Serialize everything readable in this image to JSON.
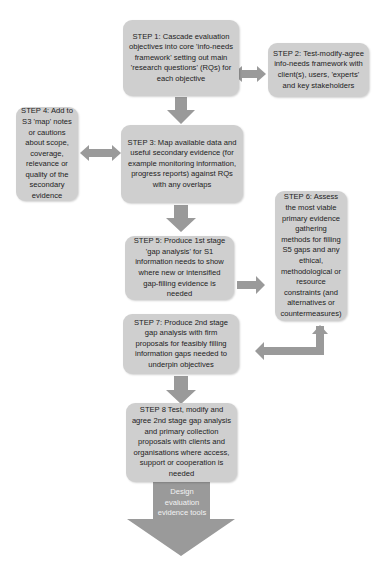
{
  "diagram": {
    "type": "flowchart",
    "colors": {
      "box_fill": "#cfcfcf",
      "arrow_fill": "#9a9a9a",
      "text": "#222222"
    },
    "steps": [
      {
        "id": "step1",
        "text": "STEP 1: Cascade evaluation objectives into core 'info-needs framework' setting out main 'research questions' (RQs) for each objective"
      },
      {
        "id": "step2",
        "text": "STEP 2: Test-modify-agree info-needs framework with client(s), users, 'experts' and key stakeholders"
      },
      {
        "id": "step3",
        "text": "STEP 3: Map available data and useful secondary evidence (for example monitoring information, progress reports) against RQs with any overlaps"
      },
      {
        "id": "step4",
        "text": "STEP 4: Add to S3 'map' notes or cautions about scope, coverage, relevance or quality of the secondary evidence"
      },
      {
        "id": "step5",
        "text": "STEP 5: Produce 1st stage 'gap analysis' for S1 information needs to show where new or intensified gap-filling evidence is needed"
      },
      {
        "id": "step6",
        "text": "STEP 6: Assess the most viable primary evidence gathering methods for filling S5 gaps and any ethical, methodological or resource constraints (and alternatives or countermeasures)"
      },
      {
        "id": "step7",
        "text": "STEP 7: Produce 2nd stage gap analysis with firm proposals for feasibly filling information gaps needed to underpin objectives"
      },
      {
        "id": "step8",
        "text": "STEP 8 Test, modify and agree 2nd stage gap analysis and primary collection proposals with clients and organisations where access, support or cooperation is needed"
      }
    ],
    "final_output": {
      "text": "Design evaluation evidence tools"
    },
    "connections": [
      {
        "from": "step1",
        "to": "step2",
        "type": "bidirectional"
      },
      {
        "from": "step1",
        "to": "step3",
        "type": "down"
      },
      {
        "from": "step3",
        "to": "step4",
        "type": "bidirectional"
      },
      {
        "from": "step3",
        "to": "step5",
        "type": "down"
      },
      {
        "from": "step5",
        "to": "step6",
        "type": "right"
      },
      {
        "from": "step6",
        "to": "step7",
        "type": "elbow-left"
      },
      {
        "from": "step7",
        "to": "step8",
        "type": "down"
      },
      {
        "from": "step8",
        "to": "final_output",
        "type": "down-large"
      }
    ]
  }
}
